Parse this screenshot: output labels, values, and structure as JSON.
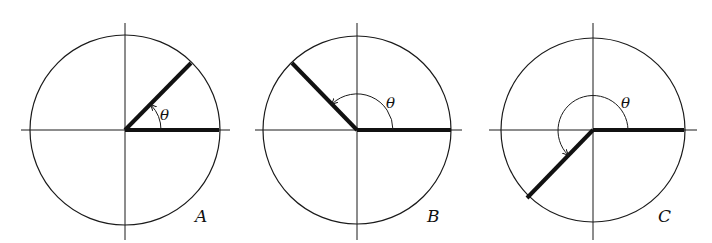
{
  "figure": {
    "panels": [
      {
        "label": "A",
        "theta_label": "θ",
        "angle_deg": 45,
        "quadrant_of_terminal_side": "I",
        "center": [
          125,
          130
        ],
        "radius": 95,
        "arc_radius": 36
      },
      {
        "label": "B",
        "theta_label": "θ",
        "angle_deg": 135,
        "quadrant_of_terminal_side": "II",
        "center": [
          357,
          130
        ],
        "radius": 94,
        "arc_radius": 36
      },
      {
        "label": "C",
        "theta_label": "θ",
        "angle_deg": 225,
        "quadrant_of_terminal_side": "III",
        "center": [
          593,
          130
        ],
        "radius": 92,
        "arc_radius": 36
      }
    ]
  }
}
